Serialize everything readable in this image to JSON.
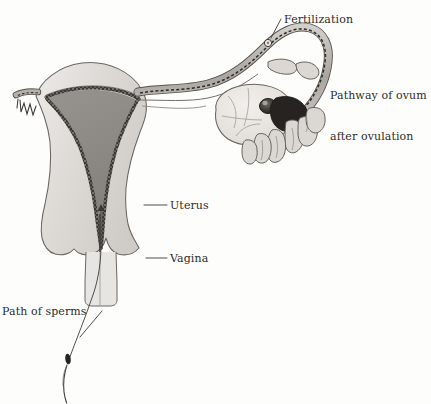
{
  "figure": {
    "width": 431,
    "height": 404,
    "background_color": "#fdfdfc"
  },
  "labels": {
    "fertilization": "Fertilization",
    "pathway_line1": "Pathway of ovum",
    "pathway_line2": "after ovulation",
    "uterus": "Uterus",
    "vagina": "Vagina",
    "path_of_sperms": "Path of sperms"
  },
  "colors": {
    "text": "#2e2c2a",
    "outline": "#5a5754",
    "leader_line": "#3c3a38",
    "myometrium_fill": "#dcdad6",
    "cavity_fill": "#8d8b88",
    "endometrium_dark": "#322f2c",
    "tube_fill": "#b9b6b2",
    "ovary_fill": "#e6e4df",
    "fimbriae_fill": "#d6d3ce",
    "sperm_body": "#26241f",
    "background": "#fdfdfc"
  },
  "anatomy": [
    {
      "name": "uterus-body",
      "description": "Pear-shaped uterine body shown in frontal cross-section with light grey myometrium wall"
    },
    {
      "name": "uterine-cavity",
      "description": "Triangular darker grey endometrial cavity in the centre of the uterus"
    },
    {
      "name": "endometrium-lining",
      "description": "Dark speckled lining bordering the uterine cavity and cervical canal"
    },
    {
      "name": "cervix",
      "description": "Narrowed lower uterine segment opening into the vagina"
    },
    {
      "name": "vagina",
      "description": "Canal below the cervix with lateral fornices"
    },
    {
      "name": "fallopian-tube-right",
      "description": "Long curved oviduct sweeping up and over toward the ovary, ending in fimbriae"
    },
    {
      "name": "fallopian-tube-left",
      "description": "Short stub of the opposite oviduct with small fimbriae at the left edge"
    },
    {
      "name": "ovary",
      "description": "Oval ovary below the tube arch showing a dark mature follicle"
    },
    {
      "name": "fimbriae",
      "description": "Finger-like projections of the tube funnel draped over the ovary"
    },
    {
      "name": "ovum",
      "description": "Small pale round ovum inside the upper arch of the tube at the fertilization site"
    },
    {
      "name": "sperm",
      "description": "Single spermatozoon with dark head and long wavy tail below the diagram"
    }
  ],
  "pathways": [
    {
      "name": "ovum-pathway",
      "style": "dashed",
      "description": "Dashed line inside the fallopian tube tracing the ovum from the ovary up and around the arch"
    },
    {
      "name": "sperm-pathway",
      "style": "solid-thin",
      "description": "Thin line from the sperm upward through the vagina and cervix into the uterine cavity"
    },
    {
      "name": "sperm-direction-arrow",
      "style": "arrowhead",
      "description": "Small arrowhead in the uterine cavity pointing upward toward the tube"
    }
  ],
  "leader_lines": [
    {
      "name": "fertilization-leader",
      "from_label": "Fertilization",
      "points_to": "ovum"
    },
    {
      "name": "uterus-leader",
      "from_label": "Uterus",
      "points_to": "uterus-body"
    },
    {
      "name": "vagina-leader",
      "from_label": "Vagina",
      "points_to": "vagina"
    },
    {
      "name": "sperms-leader",
      "from_label": "Path of sperms",
      "points_to": "sperm-pathway"
    }
  ]
}
